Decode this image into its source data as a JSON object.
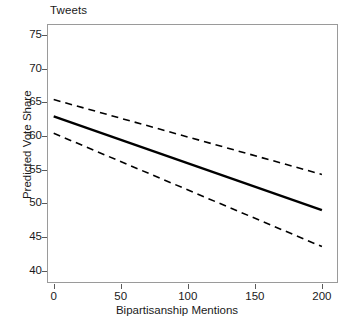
{
  "chart_data": {
    "type": "line",
    "title": "Tweets",
    "xlabel": "Bipartisanship Mentions",
    "ylabel": "Predicted Vote Share",
    "xlim": [
      -5,
      212
    ],
    "ylim": [
      38.2,
      76.6
    ],
    "xticks": [
      0,
      50,
      100,
      150,
      200
    ],
    "xticklabels": [
      "0",
      "50",
      "100",
      "150",
      "200"
    ],
    "yticks": [
      40,
      45,
      50,
      55,
      60,
      65,
      70,
      75
    ],
    "yticklabels": [
      "40",
      "45",
      "50",
      "55",
      "60",
      "65",
      "70",
      "75"
    ],
    "grid": false,
    "legend": null,
    "x": [
      0,
      200
    ],
    "series": [
      {
        "name": "Predicted vote share (fitted)",
        "style": "solid",
        "color": "#000000",
        "values": [
          62.9,
          49.0
        ]
      },
      {
        "name": "Upper confidence bound",
        "style": "dashed",
        "color": "#000000",
        "values": [
          65.4,
          54.3
        ]
      },
      {
        "name": "Lower confidence bound",
        "style": "dashed",
        "color": "#000000",
        "values": [
          60.4,
          43.6
        ]
      }
    ],
    "annotations": []
  },
  "figure": {
    "background_color": "#ffffff",
    "frame_color": "#9a9a9a",
    "text_color": "#1a1a1a"
  }
}
